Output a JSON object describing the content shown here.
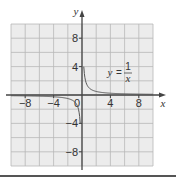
{
  "chart_data": {
    "type": "line",
    "title": "",
    "xlabel": "x",
    "ylabel": "y",
    "xlim": [
      -10,
      10
    ],
    "ylim": [
      -10,
      10
    ],
    "grid": true,
    "grid_step": 2,
    "x_ticks": [
      -8,
      -4,
      0,
      4,
      8
    ],
    "y_ticks": [
      8,
      4,
      -4,
      -8
    ],
    "x_tick_labels": [
      "−8",
      "−4",
      "0",
      "4",
      "8"
    ],
    "y_tick_labels": [
      "8",
      "4",
      "−4",
      "−8"
    ],
    "origin_label": "0",
    "series": [
      {
        "name": "y = 1/x",
        "function": "1/x",
        "branches": [
          {
            "x": [
              0.25,
              0.5,
              1,
              2,
              4,
              6,
              8,
              10
            ],
            "y": [
              4,
              2,
              1,
              0.5,
              0.25,
              0.167,
              0.125,
              0.1
            ]
          },
          {
            "x": [
              -10,
              -8,
              -6,
              -4,
              -2,
              -1,
              -0.5,
              -0.25
            ],
            "y": [
              -0.1,
              -0.125,
              -0.167,
              -0.25,
              -0.5,
              -1,
              -2,
              -4
            ]
          }
        ]
      }
    ],
    "annotations": [
      {
        "text": "y = 1/x",
        "lhs": "y",
        "equals": "=",
        "numerator": "1",
        "denominator": "x",
        "position": [
          3.5,
          3.5
        ]
      }
    ]
  },
  "colors": {
    "grid_background": "#ececec",
    "grid_line": "#b8b8b8",
    "axis": "#444444",
    "curve": "#555555",
    "bottom_rule": "#555555"
  }
}
